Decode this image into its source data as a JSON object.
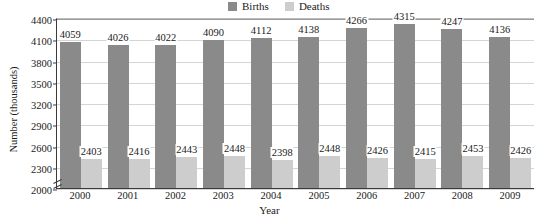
{
  "chart_data": {
    "type": "bar",
    "title": "",
    "xlabel": "Year",
    "ylabel": "Number (thousands)",
    "categories": [
      "2000",
      "2001",
      "2002",
      "2003",
      "2004",
      "2005",
      "2006",
      "2007",
      "2008",
      "2009"
    ],
    "series": [
      {
        "name": "Births",
        "color": "#8a8a8a",
        "values": [
          4059,
          4026,
          4022,
          4090,
          4112,
          4138,
          4266,
          4315,
          4247,
          4136
        ]
      },
      {
        "name": "Deaths",
        "color": "#cdcdcd",
        "values": [
          2403,
          2416,
          2443,
          2448,
          2398,
          2448,
          2426,
          2415,
          2453,
          2426
        ]
      }
    ],
    "ylim": [
      2000,
      4400
    ],
    "yticks": [
      2000,
      2300,
      2600,
      2900,
      3200,
      3500,
      3800,
      4100,
      4400
    ],
    "grid": true,
    "axis_break": true,
    "legend_position": "top-center",
    "data_labels": true
  },
  "legend": {
    "entries": [
      {
        "label": "Births",
        "color": "#8a8a8a"
      },
      {
        "label": "Deaths",
        "color": "#cdcdcd"
      }
    ]
  }
}
